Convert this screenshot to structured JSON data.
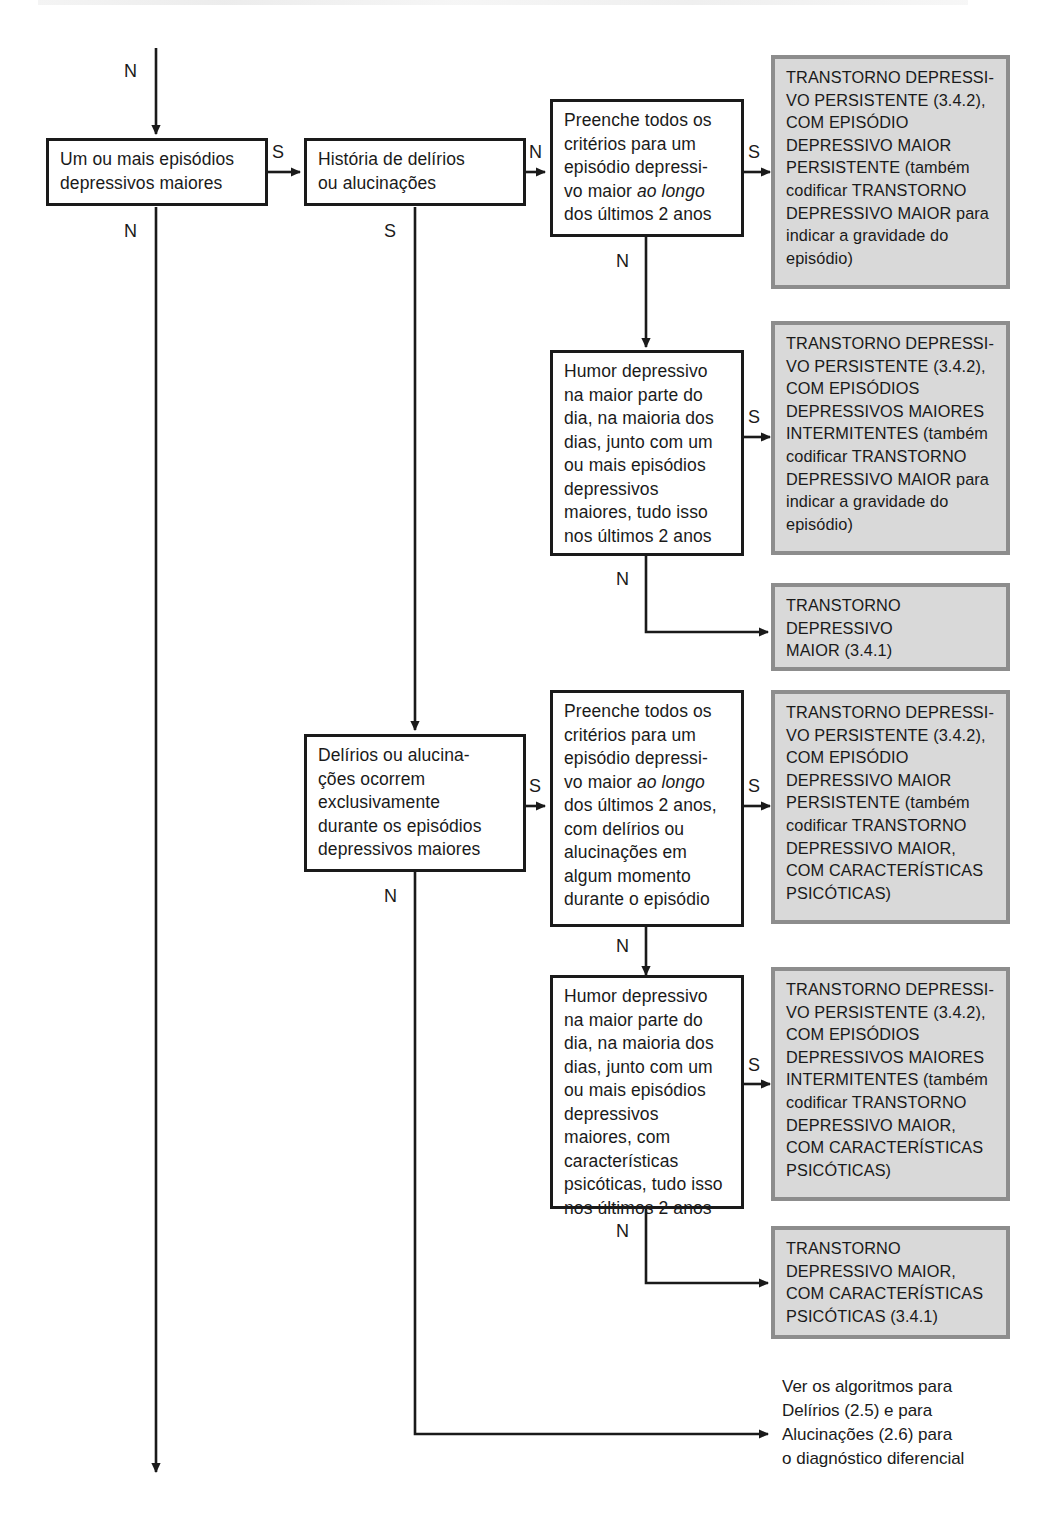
{
  "diagram": {
    "language": "pt-BR",
    "yes_label": "S",
    "no_label": "N",
    "colors": {
      "line": "#1a1a1a",
      "question_box_fill": "#ffffff",
      "question_box_border": "#1a1a1a",
      "outcome_box_fill": "#d9d9d9",
      "outcome_box_border": "#8d8d8d",
      "text": "#1a1a1a"
    }
  },
  "nodes": {
    "q_episodios": {
      "kind": "question",
      "text": "Um ou mais episódios\ndepressivos maiores"
    },
    "q_historia": {
      "kind": "question",
      "text": "História de delírios\nou alucinações"
    },
    "q_criterios_1": {
      "kind": "question",
      "text_before": "Preenche todos os\ncritérios para um\nepisódio depressi-\nvo maior ",
      "text_italic": "ao longo",
      "text_after": "\ndos últimos 2 anos"
    },
    "q_humor_1": {
      "kind": "question",
      "text": "Humor depressivo\nna maior parte do\ndia, na maioria dos\ndias, junto com um\nou mais episódios\ndepressivos\nmaiores, tudo isso\nnos últimos 2 anos"
    },
    "q_delirios_excl": {
      "kind": "question",
      "text": "Delírios ou alucina-\nções ocorrem\nexclusivamente\ndurante os episódios\ndepressivos maiores"
    },
    "q_criterios_2": {
      "kind": "question",
      "text_before": "Preenche todos os\ncritérios para um\nepisódio depressi-\nvo maior ",
      "text_italic": "ao longo",
      "text_after": "\ndos últimos 2 anos,\ncom delírios ou\nalucinações em\nalgum momento\ndurante o episódio"
    },
    "q_humor_2": {
      "kind": "question",
      "text": "Humor depressivo\nna maior parte do\ndia, na maioria dos\ndias, junto com um\nou mais episódios\ndepressivos\nmaiores, com\ncaracterísticas\npsicóticas, tudo isso\nnos últimos 2 anos"
    },
    "out_tdp_episodio": {
      "kind": "outcome",
      "text": "TRANSTORNO DEPRESSI-\nVO PERSISTENTE (3.4.2),\nCOM EPISÓDIO\nDEPRESSIVO MAIOR\nPERSISTENTE (também\ncodificar TRANSTORNO\nDEPRESSIVO MAIOR para\nindicar a gravidade do\nepisódio)"
    },
    "out_tdp_intermitentes": {
      "kind": "outcome",
      "text": "TRANSTORNO DEPRESSI-\nVO PERSISTENTE (3.4.2),\nCOM EPISÓDIOS\nDEPRESSIVOS MAIORES\nINTERMITENTES (também\ncodificar TRANSTORNO\nDEPRESSIVO MAIOR para\nindicar a gravidade do\nepisódio)"
    },
    "out_tdm": {
      "kind": "outcome",
      "text": "TRANSTORNO\nDEPRESSIVO\nMAIOR (3.4.1)"
    },
    "out_tdp_episodio_psic": {
      "kind": "outcome",
      "text": "TRANSTORNO DEPRESSI-\nVO PERSISTENTE (3.4.2),\nCOM EPISÓDIO\nDEPRESSIVO MAIOR\nPERSISTENTE (também\ncodificar TRANSTORNO\nDEPRESSIVO MAIOR,\nCOM CARACTERÍSTICAS\nPSICÓTICAS)"
    },
    "out_tdp_intermitentes_psic": {
      "kind": "outcome",
      "text": "TRANSTORNO DEPRESSI-\nVO PERSISTENTE (3.4.2),\nCOM EPISÓDIOS\nDEPRESSIVOS MAIORES\nINTERMITENTES (também\ncodificar TRANSTORNO\nDEPRESSIVO MAIOR,\nCOM CARACTERÍSTICAS\nPSICÓTICAS)"
    },
    "out_tdm_psic": {
      "kind": "outcome",
      "text": "TRANSTORNO\nDEPRESSIVO MAIOR,\nCOM CARACTERÍSTICAS\nPSICÓTICAS (3.4.1)"
    },
    "note_algoritmos": {
      "kind": "note",
      "text": "Ver os algoritmos para\nDelírios (2.5) e para\nAlucinações (2.6) para\no diagnóstico diferencial"
    }
  },
  "edge_labels": {
    "entry_n": "N",
    "episodios_to_historia": "S",
    "episodios_down_n": "N",
    "historia_to_criterios1": "N",
    "historia_down_s": "S",
    "criterios1_to_out": "S",
    "criterios1_down_n": "N",
    "humor1_to_out": "S",
    "humor1_down_n": "N",
    "delirios_to_criterios2": "S",
    "delirios_down_n": "N",
    "criterios2_to_out": "S",
    "criterios2_down_n": "N",
    "humor2_to_out": "S",
    "humor2_down_n": "N"
  }
}
